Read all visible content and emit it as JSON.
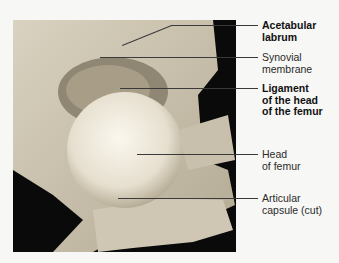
{
  "figure": {
    "type": "anatomical-photo",
    "labels": [
      {
        "id": "acetabular-labrum",
        "line1": "Acetabular",
        "line2": "labrum",
        "bold": true
      },
      {
        "id": "synovial-membrane",
        "line1": "Synovial",
        "line2": "membrane",
        "bold": false
      },
      {
        "id": "ligament-head-femur",
        "line1": "Ligament",
        "line2": "of the head",
        "line3": "of the femur",
        "bold": true
      },
      {
        "id": "head-of-femur",
        "line1": "Head",
        "line2": "of femur",
        "bold": false
      },
      {
        "id": "articular-capsule",
        "line1": "Articular",
        "line2": "capsule (cut)",
        "bold": false
      }
    ]
  }
}
